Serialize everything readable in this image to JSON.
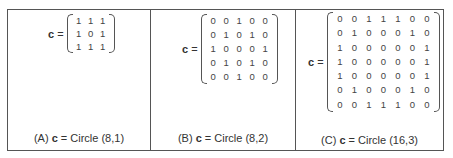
{
  "figure": {
    "panels": [
      {
        "id": "A",
        "lhs_symbol": "c",
        "equals": "=",
        "matrix": [
          [
            "1",
            "1",
            "1"
          ],
          [
            "1",
            "0",
            "1"
          ],
          [
            "1",
            "1",
            "1"
          ]
        ],
        "caption_prefix": "(A)",
        "caption_symbol": "c",
        "caption_suffix": "= Circle (8,1)"
      },
      {
        "id": "B",
        "lhs_symbol": "c",
        "equals": "=",
        "matrix": [
          [
            "0",
            "0",
            "1",
            "0",
            "0"
          ],
          [
            "0",
            "1",
            "0",
            "1",
            "0"
          ],
          [
            "1",
            "0",
            "0",
            "0",
            "1"
          ],
          [
            "0",
            "1",
            "0",
            "1",
            "0"
          ],
          [
            "0",
            "0",
            "1",
            "0",
            "0"
          ]
        ],
        "caption_prefix": "(B)",
        "caption_symbol": "c",
        "caption_suffix": "= Circle (8,2)"
      },
      {
        "id": "C",
        "lhs_symbol": "c",
        "equals": "=",
        "matrix": [
          [
            "0",
            "0",
            "1",
            "1",
            "1",
            "0",
            "0"
          ],
          [
            "0",
            "1",
            "0",
            "0",
            "0",
            "1",
            "0"
          ],
          [
            "1",
            "0",
            "0",
            "0",
            "0",
            "0",
            "1"
          ],
          [
            "1",
            "0",
            "0",
            "0",
            "0",
            "0",
            "1"
          ],
          [
            "1",
            "0",
            "0",
            "0",
            "0",
            "0",
            "1"
          ],
          [
            "0",
            "1",
            "0",
            "0",
            "0",
            "1",
            "0"
          ],
          [
            "0",
            "0",
            "1",
            "1",
            "1",
            "0",
            "0"
          ]
        ],
        "caption_prefix": "(C)",
        "caption_symbol": "c",
        "caption_suffix": "= Circle (16,3)"
      }
    ]
  }
}
